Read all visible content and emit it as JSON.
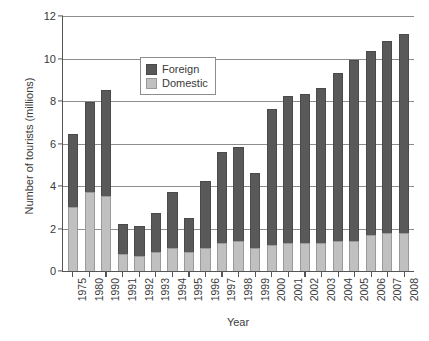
{
  "chart_data": {
    "type": "bar",
    "subtype": "stacked-bar",
    "title": "",
    "xlabel": "Year",
    "ylabel": "Number of tourists (millions)",
    "ylim": [
      0,
      12
    ],
    "yticks": [
      0,
      2,
      4,
      6,
      8,
      10,
      12
    ],
    "ytick_labels": [
      "0",
      "2",
      "4",
      "6",
      "8",
      "10",
      "12"
    ],
    "grid": "horizontal",
    "legend_position": "upper-center-left",
    "categories": [
      "1975",
      "1980",
      "1990",
      "1991",
      "1992",
      "1993",
      "1994",
      "1995",
      "1996",
      "1997",
      "1998",
      "1999",
      "2000",
      "2001",
      "2002",
      "2003",
      "2004",
      "2005",
      "2006",
      "2007",
      "2008"
    ],
    "series": [
      {
        "name": "Domestic",
        "color": "#c0c0c0",
        "values": [
          3.0,
          3.7,
          3.5,
          0.8,
          0.7,
          0.9,
          1.1,
          0.9,
          1.1,
          1.3,
          1.4,
          1.1,
          1.2,
          1.3,
          1.3,
          1.3,
          1.4,
          1.4,
          1.7,
          1.8,
          1.8
        ]
      },
      {
        "name": "Foreign",
        "color": "#595959",
        "values": [
          3.4,
          4.2,
          5.0,
          1.4,
          1.4,
          1.8,
          2.6,
          1.6,
          3.1,
          4.3,
          4.4,
          3.5,
          6.4,
          6.9,
          7.0,
          7.3,
          7.9,
          8.5,
          8.6,
          9.0,
          9.3
        ]
      }
    ],
    "totals": [
      6.4,
      7.9,
      8.5,
      2.2,
      2.1,
      2.7,
      3.7,
      2.5,
      4.2,
      5.6,
      5.8,
      4.6,
      7.6,
      8.2,
      8.3,
      8.6,
      9.3,
      9.9,
      10.3,
      10.8,
      11.1
    ],
    "legend": [
      {
        "label": "Foreign",
        "color": "#595959",
        "swatch": "foreign"
      },
      {
        "label": "Domestic",
        "color": "#c0c0c0",
        "swatch": "domestic"
      }
    ]
  }
}
